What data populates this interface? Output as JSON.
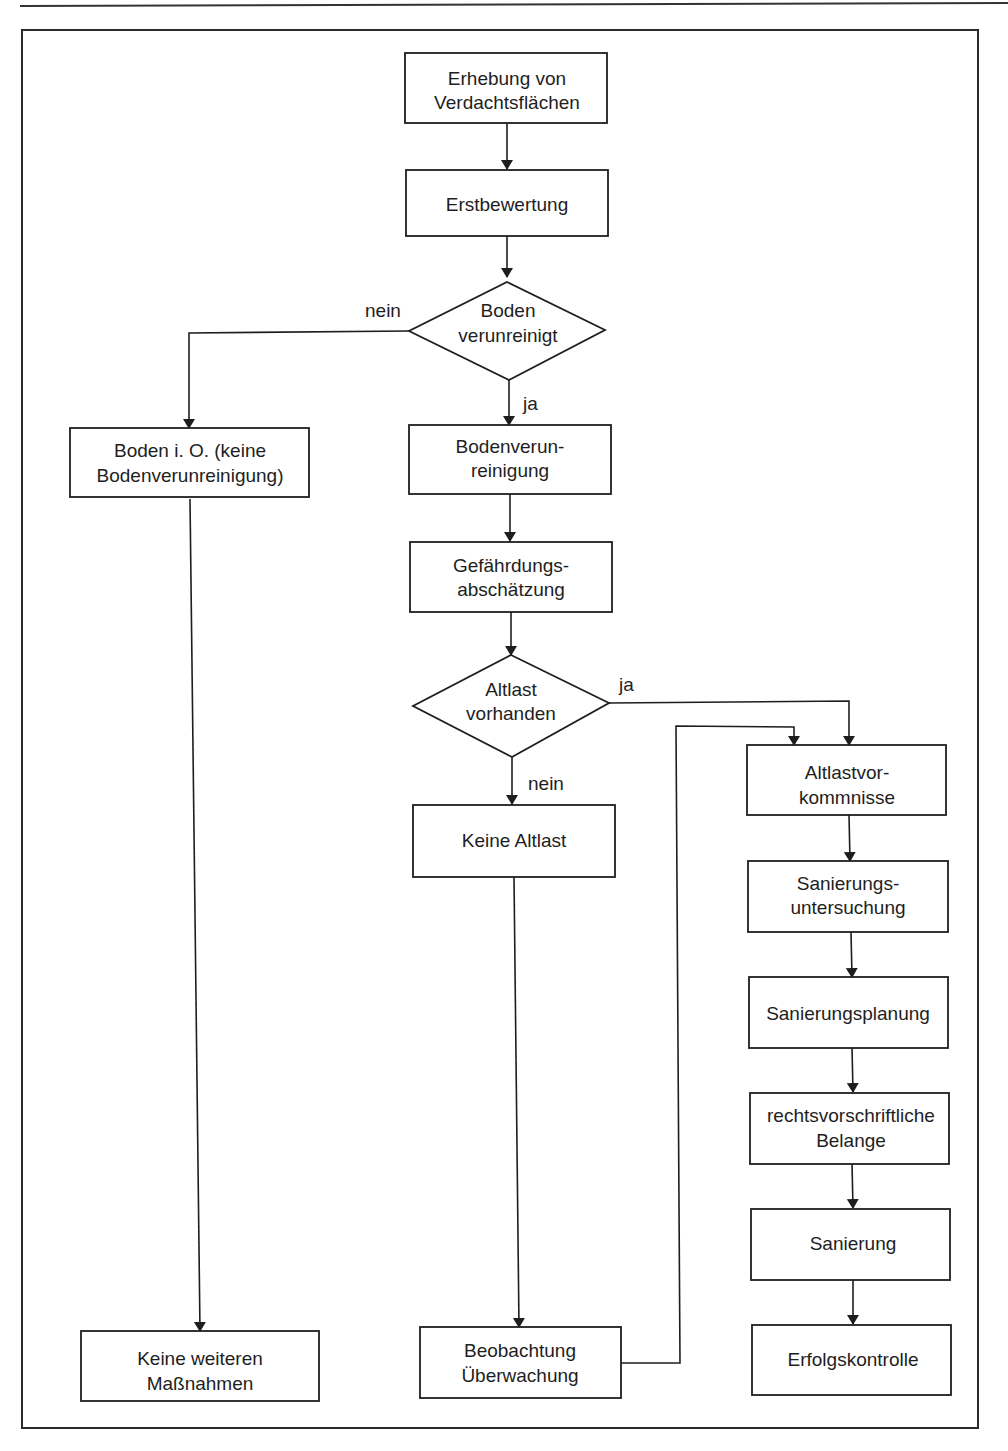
{
  "nodes": {
    "erhebung": [
      "Erhebung von",
      "Verdachtsflächen"
    ],
    "erstbewertung": [
      "Erstbewertung"
    ],
    "boden_verunreinigt": [
      "Boden",
      "verunreinigt"
    ],
    "boden_io": [
      "Boden i. O. (keine",
      "Bodenverunreinigung)"
    ],
    "bodenverunreinigung": [
      "Bodenverun-",
      "reinigung"
    ],
    "gefaehrdung": [
      "Gefährdungs-",
      "abschätzung"
    ],
    "altlast_vorhanden": [
      "Altlast",
      "vorhanden"
    ],
    "keine_altlast": [
      "Keine Altlast"
    ],
    "altlastvorkommnisse": [
      "Altlastvor-",
      "kommnisse"
    ],
    "sanierungsuntersuchung": [
      "Sanierungs-",
      "untersuchung"
    ],
    "sanierungsplanung": [
      "Sanierungsplanung"
    ],
    "rechtsvorschriftlich": [
      "rechtsvorschriftliche",
      "Belange"
    ],
    "sanierung": [
      "Sanierung"
    ],
    "erfolgskontrolle": [
      "Erfolgskontrolle"
    ],
    "keine_massnahmen": [
      "Keine weiteren",
      "Maßnahmen"
    ],
    "beobachtung": [
      "Beobachtung",
      "Überwachung"
    ]
  },
  "labels": {
    "boden_nein": "nein",
    "boden_ja": "ja",
    "altlast_ja": "ja",
    "altlast_nein": "nein"
  }
}
